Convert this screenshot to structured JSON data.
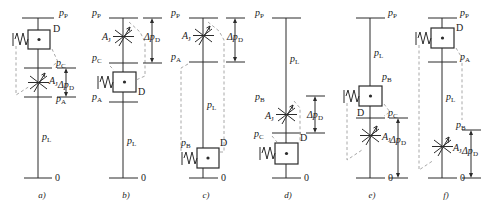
{
  "figure": {
    "type": "hydraulic-circuit-diagram",
    "panel_count": 6,
    "symbols": {
      "damper": "D",
      "throttle_area": "A_J",
      "delta_label": "Δp_D",
      "ground": "0"
    },
    "colors": {
      "line": "#2b2b2b",
      "dashed": "#9a9a9a",
      "text": "#1a1a1a"
    }
  },
  "panels": [
    {
      "caption": "a)",
      "top_label": "p_P",
      "ground_label": "0",
      "damper_label": "D",
      "valve_label": "A_J",
      "delta_label": "Δp_D",
      "nodes": [
        "p_P",
        "p_C",
        "p_A",
        "p_L",
        "0"
      ],
      "order": "damper-then-valve",
      "line_label": "p_L"
    },
    {
      "caption": "b)",
      "top_label": "p_P",
      "ground_label": "0",
      "damper_label": "D",
      "valve_label": "A_J",
      "delta_label": "Δp_D",
      "nodes": [
        "p_P",
        "p_C",
        "p_A",
        "p_L",
        "0"
      ],
      "order": "valve-then-damper",
      "line_label": "p_L"
    },
    {
      "caption": "c)",
      "top_label": "p_P",
      "ground_label": "0",
      "damper_label": "D",
      "valve_label": "A_J",
      "delta_label": "Δp_D",
      "nodes": [
        "p_P",
        "p_A",
        "p_L",
        "p_B",
        "0"
      ],
      "order": "valve-top-damper-bottom",
      "line_label": "p_L"
    },
    {
      "caption": "d)",
      "top_label": "p_P",
      "ground_label": "0",
      "damper_label": "D",
      "valve_label": "A_J",
      "delta_label": "Δp_D",
      "nodes": [
        "p_P",
        "p_L",
        "p_B",
        "p_C",
        "0"
      ],
      "order": "line-valve-damper",
      "line_label": "p_L"
    },
    {
      "caption": "e)",
      "top_label": "p_P",
      "ground_label": "0",
      "damper_label": "D",
      "valve_label": "A_J",
      "delta_label": "Δp_D",
      "nodes": [
        "p_P",
        "p_L",
        "p_B",
        "p_C",
        "0"
      ],
      "order": "line-damper-valve",
      "line_label": "p_L"
    },
    {
      "caption": "f)",
      "top_label": "p_P",
      "ground_label": "0",
      "damper_label": "D",
      "valve_label": "A_J",
      "delta_label": "Δp_D",
      "nodes": [
        "p_P",
        "p_A",
        "p_L",
        "p_B",
        "0"
      ],
      "order": "damper-top-valve-bottom",
      "line_label": "p_L"
    }
  ],
  "labels": {
    "pP": "p",
    "pP_sub": "P",
    "pC": "p",
    "pC_sub": "C",
    "pA": "p",
    "pA_sub": "A",
    "pB": "p",
    "pB_sub": "B",
    "pL": "p",
    "pL_sub": "L",
    "zero": "0",
    "D": "D",
    "A": "A",
    "A_sub": "J",
    "delta": "Δp",
    "delta_sub": "D"
  }
}
